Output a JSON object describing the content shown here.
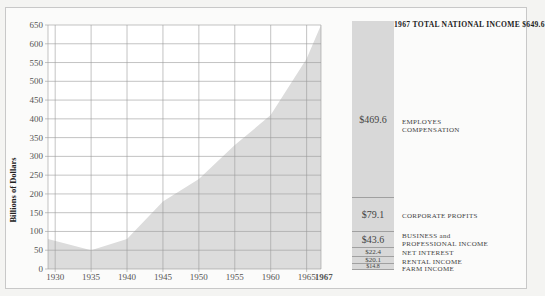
{
  "chart_data": [
    {
      "type": "area",
      "title": "",
      "xlabel": "",
      "ylabel": "Billions of Dollars",
      "ylim": [
        0,
        650
      ],
      "yticks": [
        0,
        50,
        100,
        150,
        200,
        250,
        300,
        350,
        400,
        450,
        500,
        550,
        600,
        650
      ],
      "xticks": [
        "1930",
        "1935",
        "1940",
        "1945",
        "1950",
        "1955",
        "1960",
        "1965",
        "1967"
      ],
      "grid": true,
      "x": [
        1929,
        1935,
        1940,
        1945,
        1950,
        1955,
        1960,
        1965,
        1967
      ],
      "series": [
        {
          "name": "Total National Income",
          "values": [
            80,
            50,
            80,
            180,
            240,
            330,
            410,
            560,
            650
          ]
        }
      ],
      "fill_color": "#dcdcdc"
    },
    {
      "type": "bar",
      "stacked": true,
      "title": "1967 TOTAL NATIONAL INCOME $649.6",
      "categories": [
        "1967"
      ],
      "series": [
        {
          "name": "FARM INCOME",
          "value": 14.8,
          "label": "$14.8"
        },
        {
          "name": "RENTAL INCOME",
          "value": 20.1,
          "label": "$20.1"
        },
        {
          "name": "NET INTEREST",
          "value": 22.4,
          "label": "$22.4"
        },
        {
          "name": "BUSINESS and PROFESSIONAL INCOME",
          "value": 43.6,
          "label": "$43.6"
        },
        {
          "name": "CORPORATE PROFITS",
          "value": 79.1,
          "label": "$79.1"
        },
        {
          "name": "EMPLOYES COMPENSATION",
          "value": 469.6,
          "label": "$469.6"
        }
      ],
      "total": 649.6
    }
  ],
  "left_chart": {
    "ylabel": "Billions of Dollars",
    "yticks": [
      "0",
      "50",
      "100",
      "150",
      "200",
      "250",
      "300",
      "350",
      "400",
      "450",
      "500",
      "550",
      "600",
      "650"
    ],
    "xticks": [
      "1930",
      "1935",
      "1940",
      "1945",
      "1950",
      "1955",
      "1960",
      "1965",
      "1967"
    ]
  },
  "right_chart": {
    "title": "1967 TOTAL NATIONAL INCOME $649.6",
    "segments": [
      {
        "value": "$469.6",
        "label1": "EMPLOYES",
        "label2": "COMPENSATION"
      },
      {
        "value": "$79.1",
        "label1": "CORPORATE PROFITS",
        "label2": ""
      },
      {
        "value": "$43.6",
        "label1": "BUSINESS and",
        "label2": "PROFESSIONAL INCOME"
      },
      {
        "value": "$22.4",
        "label1": "NET INTEREST",
        "label2": ""
      },
      {
        "value": "$20.1",
        "label1": "RENTAL INCOME",
        "label2": ""
      },
      {
        "value": "$14.8",
        "label1": "FARM INCOME",
        "label2": ""
      }
    ]
  }
}
